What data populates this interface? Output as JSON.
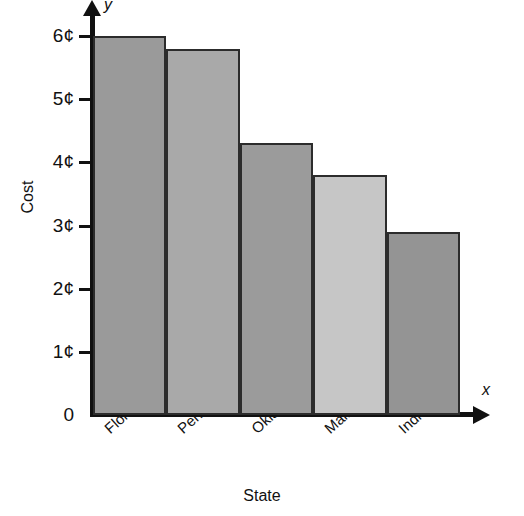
{
  "chart_data": {
    "type": "bar",
    "title": "",
    "xlabel": "State",
    "ylabel": "Cost",
    "x_axis_symbol": "x",
    "y_axis_symbol": "y",
    "categories": [
      "Florida",
      "Pennsylvania",
      "Oklahoma",
      "Maine",
      "Indiana"
    ],
    "values": [
      6.0,
      5.8,
      4.3,
      3.8,
      2.9
    ],
    "value_unit": "¢",
    "ylim": [
      0,
      6.35
    ],
    "ytick_values": [
      0,
      1,
      2,
      3,
      4,
      5,
      6
    ],
    "ytick_labels": [
      "0",
      "1¢",
      "2¢",
      "3¢",
      "4¢",
      "5¢",
      "6¢"
    ],
    "grid": false,
    "legend": false,
    "bar_colors": [
      "#9a9a9a",
      "#a9a9a9",
      "#9b9b9b",
      "#c6c6c6",
      "#949494"
    ],
    "bar_border_color": "#2c2c2c",
    "axis_color": "#111111",
    "background_color": "#ffffff"
  }
}
